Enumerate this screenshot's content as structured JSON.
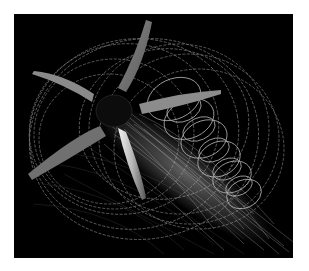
{
  "image": {
    "subject": "propeller with tip-vortex wake visualization",
    "background_color": "#000000",
    "page_background": "#ffffff",
    "blade_count": 5,
    "blade_color": "#9a9a9a",
    "wake_color": "#cfcfcf"
  }
}
